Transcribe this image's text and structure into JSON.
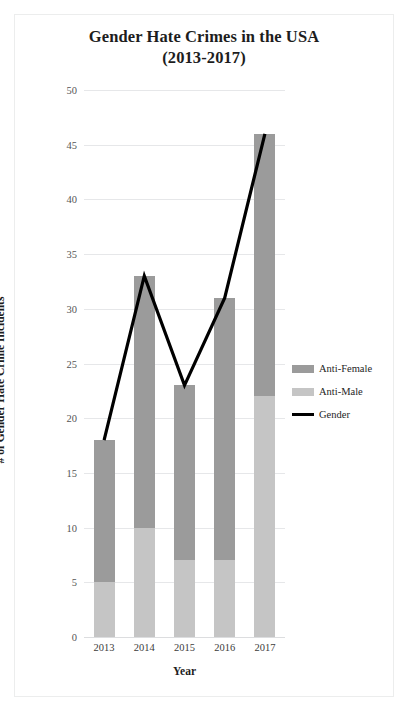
{
  "chart_data": {
    "type": "bar",
    "title": "Gender Hate Crimes in the USA (2013-2017)",
    "title_lines": [
      "Gender Hate Crimes in the USA",
      "(2013-2017)"
    ],
    "xlabel": "Year",
    "ylabel": "# of Gender Hate Crime Incidents",
    "categories": [
      "2013",
      "2014",
      "2015",
      "2016",
      "2017"
    ],
    "ylim": [
      0,
      50
    ],
    "ytick_step": 5,
    "ytick_labels": [
      "50",
      "45",
      "40",
      "35",
      "30",
      "25",
      "20",
      "15",
      "10",
      "5",
      "0"
    ],
    "grid": true,
    "grid_axis": "y",
    "legend_position": "right",
    "stacked": true,
    "series": [
      {
        "name": "Anti-Female",
        "kind": "bar",
        "color": "#9b9b9b",
        "values": [
          13,
          23,
          16,
          24,
          24
        ]
      },
      {
        "name": "Anti-Male",
        "kind": "bar",
        "color": "#c5c5c5",
        "values": [
          5,
          10,
          7,
          7,
          22
        ]
      },
      {
        "name": "Gender",
        "kind": "line",
        "color": "#000000",
        "values": [
          18,
          33,
          23,
          31,
          46
        ]
      }
    ]
  },
  "legend": {
    "items": [
      {
        "label": "Anti-Female",
        "color": "#9b9b9b",
        "type": "swatch"
      },
      {
        "label": "Anti-Male",
        "color": "#c5c5c5",
        "type": "swatch"
      },
      {
        "label": "Gender",
        "color": "#000000",
        "type": "line"
      }
    ]
  }
}
